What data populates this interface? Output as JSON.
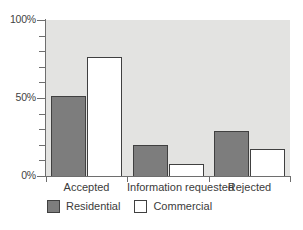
{
  "chart_data": {
    "type": "bar",
    "title": "",
    "subtitle": "",
    "xlabel": "",
    "ylabel": "",
    "categories": [
      "Accepted",
      "Information requested",
      "Rejected"
    ],
    "series": [
      {
        "name": "Residential",
        "values": [
          51,
          20,
          29
        ],
        "color": "#7d7d7d"
      },
      {
        "name": "Commercial",
        "values": [
          76,
          8,
          17
        ],
        "color": "#ffffff"
      }
    ],
    "ylim": [
      0,
      100
    ],
    "ytick_values": [
      0,
      10,
      20,
      30,
      40,
      50,
      60,
      70,
      80,
      90,
      100
    ],
    "ytick_labels_shown": [
      "0%",
      "50%",
      "100%"
    ],
    "value_unit": "%",
    "grid": false,
    "legend_position": "bottom-left",
    "plot_background": "#e3e3e1",
    "axis_color": "#6e6e6e",
    "bar_edge_color": "#404040"
  },
  "axis": {
    "y": {
      "labels": [
        {
          "text": "100%",
          "value": 100
        },
        {
          "text": "50%",
          "value": 50
        },
        {
          "text": "0%",
          "value": 0
        }
      ]
    },
    "x": {
      "labels": [
        "Accepted",
        "Information requested",
        "Rejected"
      ]
    }
  },
  "legend": {
    "items": [
      {
        "label": "Residential",
        "swatch": "filled-gray-swatch"
      },
      {
        "label": "Commercial",
        "swatch": "outlined-white-swatch"
      }
    ]
  }
}
